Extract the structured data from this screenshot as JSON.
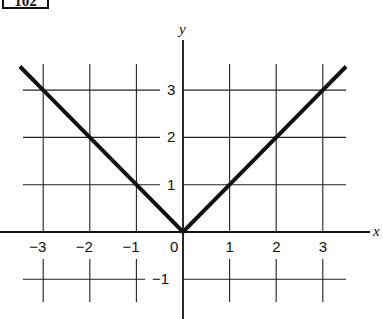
{
  "figure": {
    "problem_number": "102"
  },
  "chart_data": {
    "type": "line",
    "title": "",
    "function": "y = |x|",
    "xlabel": "x",
    "ylabel": "y",
    "xlim": [
      -3.5,
      3.5
    ],
    "ylim": [
      -1,
      3.5
    ],
    "grid": true,
    "x_ticks": [
      -3,
      -2,
      -1,
      0,
      1,
      2,
      3
    ],
    "x_tick_labels": [
      "−3",
      "−2",
      "−1",
      "0",
      "1",
      "2",
      "3"
    ],
    "y_ticks": [
      -1,
      1,
      2,
      3
    ],
    "y_tick_labels": [
      "−1",
      "1",
      "2",
      "3"
    ],
    "series": [
      {
        "name": "y = |x|",
        "x": [
          -3.5,
          -3,
          -2,
          -1,
          0,
          1,
          2,
          3,
          3.5
        ],
        "y": [
          3.5,
          3,
          2,
          1,
          0,
          1,
          2,
          3,
          3.5
        ]
      }
    ],
    "color": "#111111"
  }
}
